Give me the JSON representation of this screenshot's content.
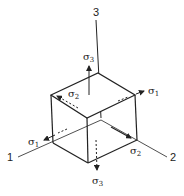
{
  "figure": {
    "type": "stress-element-cube",
    "axes": [
      {
        "id": "axis-1",
        "label": "1"
      },
      {
        "id": "axis-2",
        "label": "2"
      },
      {
        "id": "axis-3",
        "label": "3"
      }
    ],
    "stresses": {
      "sigma3_top": {
        "symbol": "σ",
        "index": "3"
      },
      "sigma3_bottom": {
        "symbol": "σ",
        "index": "3"
      },
      "sigma1_right": {
        "symbol": "σ",
        "index": "1"
      },
      "sigma1_left": {
        "symbol": "σ",
        "index": "1"
      },
      "sigma2_top": {
        "symbol": "σ",
        "index": "2"
      },
      "sigma2_bottom": {
        "symbol": "σ",
        "index": "2"
      }
    },
    "colors": {
      "line": "#222222",
      "background": "#ffffff"
    }
  }
}
